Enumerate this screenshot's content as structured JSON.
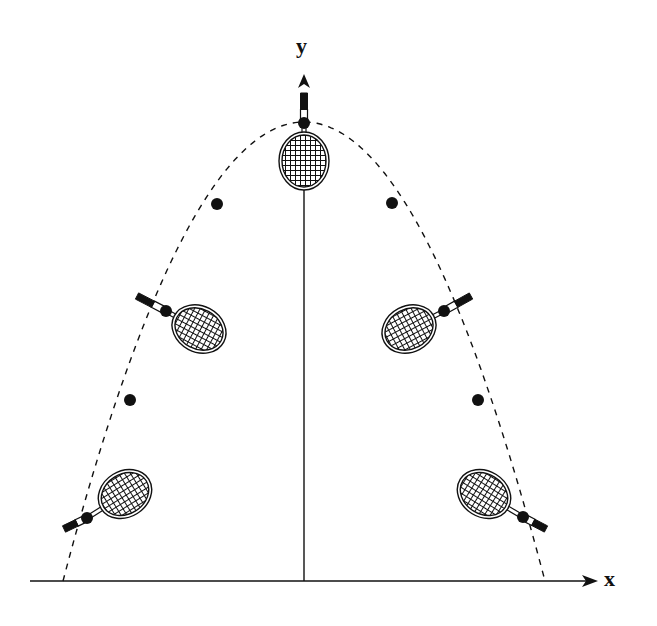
{
  "diagram": {
    "title": "",
    "axes": {
      "x_label": "x",
      "y_label": "y",
      "origin": [
        304,
        581
      ],
      "x_axis": {
        "from": [
          30,
          581
        ],
        "to": [
          598,
          581
        ]
      },
      "y_axis": {
        "from": [
          304,
          581
        ],
        "to": [
          304,
          74
        ]
      }
    },
    "trajectory": {
      "type": "parabola",
      "style": "dashed",
      "left_ground": [
        63,
        581
      ],
      "apex": [
        304,
        122
      ],
      "right_ground": [
        545,
        581
      ]
    },
    "balls": [
      {
        "id": "ball-top",
        "x": 304,
        "y": 123
      },
      {
        "id": "ball-left-upper",
        "x": 217,
        "y": 204
      },
      {
        "id": "ball-left-middle",
        "x": 166,
        "y": 311
      },
      {
        "id": "ball-left-lower",
        "x": 130,
        "y": 400
      },
      {
        "id": "ball-left-bottom",
        "x": 87,
        "y": 518
      },
      {
        "id": "ball-right-upper",
        "x": 392,
        "y": 203
      },
      {
        "id": "ball-right-middle",
        "x": 444,
        "y": 311
      },
      {
        "id": "ball-right-lower",
        "x": 478,
        "y": 400
      },
      {
        "id": "ball-right-bottom",
        "x": 523,
        "y": 517
      }
    ],
    "rackets": [
      {
        "id": "racket-top",
        "head_center": [
          304,
          161
        ],
        "head_rx": 22,
        "head_ry": 26,
        "angle": 0,
        "handle_end": [
          304,
          93
        ],
        "ball": [
          304,
          123
        ]
      },
      {
        "id": "racket-left-middle",
        "head_center": [
          199,
          329
        ],
        "head_rx": 25,
        "head_ry": 20,
        "angle": 28,
        "handle_end": [
          137,
          296
        ],
        "ball": [
          166,
          311
        ]
      },
      {
        "id": "racket-left-bottom",
        "head_center": [
          125,
          494
        ],
        "head_rx": 25,
        "head_ry": 20,
        "angle": -32,
        "handle_end": [
          64,
          529
        ],
        "ball": [
          87,
          518
        ]
      },
      {
        "id": "racket-right-middle",
        "head_center": [
          409,
          329
        ],
        "head_rx": 25,
        "head_ry": 20,
        "angle": -28,
        "handle_end": [
          471,
          296
        ],
        "ball": [
          444,
          311
        ]
      },
      {
        "id": "racket-right-bottom",
        "head_center": [
          484,
          494
        ],
        "head_rx": 25,
        "head_ry": 20,
        "angle": 32,
        "handle_end": [
          546,
          529
        ],
        "ball": [
          523,
          517
        ]
      }
    ],
    "colors": {
      "ink": "#111111",
      "background": "#ffffff"
    }
  }
}
